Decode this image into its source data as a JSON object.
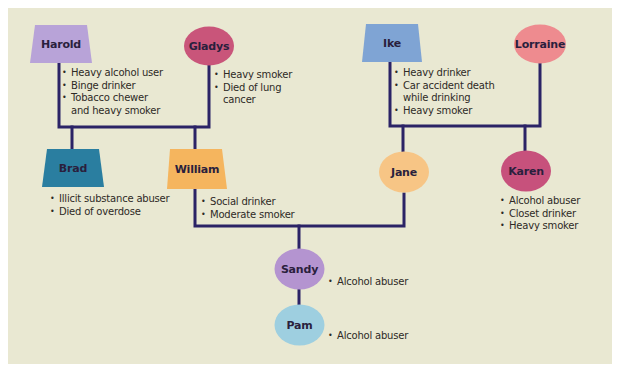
{
  "colors": {
    "background": "#e9e8d2",
    "line": "#2b2366",
    "harold": "#b8a3d8",
    "gladys": "#c9557a",
    "ike": "#7fa4d4",
    "lorraine": "#ee8b8f",
    "brad": "#2a7ea0",
    "william": "#f5b55e",
    "jane": "#f7c585",
    "karen": "#c7517c",
    "sandy": "#b494d0",
    "pam": "#9ecfe0"
  },
  "legend_shapes": {
    "trapezoid": "male",
    "circle": "female"
  },
  "people": {
    "harold": {
      "name": "Harold",
      "sex": "male",
      "notes": [
        "Heavy alcohol user",
        "Binge drinker",
        "Tobacco chewer",
        "and heavy smoker"
      ]
    },
    "gladys": {
      "name": "Gladys",
      "sex": "female",
      "notes": [
        "Heavy smoker",
        "Died of lung",
        "cancer"
      ]
    },
    "ike": {
      "name": "Ike",
      "sex": "male",
      "notes": [
        "Heavy drinker",
        "Car accident death",
        "while drinking",
        "Heavy smoker"
      ]
    },
    "lorraine": {
      "name": "Lorraine",
      "sex": "female",
      "notes": []
    },
    "brad": {
      "name": "Brad",
      "sex": "male",
      "notes": [
        "Illicit substance abuser",
        "Died of overdose"
      ]
    },
    "william": {
      "name": "William",
      "sex": "male",
      "notes": [
        "Social drinker",
        "Moderate smoker"
      ]
    },
    "jane": {
      "name": "Jane",
      "sex": "female",
      "notes": []
    },
    "karen": {
      "name": "Karen",
      "sex": "female",
      "notes": [
        "Alcohol abuser",
        "Closet drinker",
        "Heavy smoker"
      ]
    },
    "sandy": {
      "name": "Sandy",
      "sex": "female",
      "notes": [
        "Alcohol abuser"
      ]
    },
    "pam": {
      "name": "Pam",
      "sex": "female",
      "notes": [
        "Alcohol abuser"
      ]
    }
  },
  "relationships": [
    {
      "parents": [
        "Harold",
        "Gladys"
      ],
      "children": [
        "Brad",
        "William"
      ]
    },
    {
      "parents": [
        "Ike",
        "Lorraine"
      ],
      "children": [
        "Jane",
        "Karen"
      ]
    },
    {
      "parents": [
        "William",
        "Jane"
      ],
      "children": [
        "Sandy"
      ]
    },
    {
      "parents": [
        "Sandy"
      ],
      "children": [
        "Pam"
      ]
    }
  ]
}
